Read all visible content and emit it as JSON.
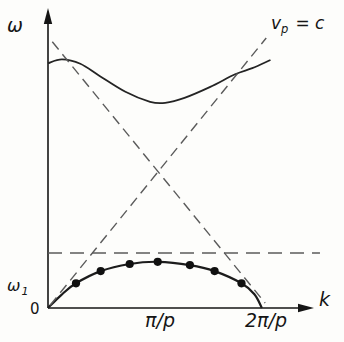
{
  "figure": {
    "background": "#fdfdfb",
    "colors": {
      "axis": "#151515",
      "text": "#151515",
      "solid_curve": "#1c1c1c",
      "dashed_line": "#5b5b5b",
      "dot": "#101010"
    }
  },
  "labels": {
    "y_axis": "ω",
    "y_tick_base": "ω",
    "y_tick_sub": "1",
    "origin": "0",
    "x_tick_mid": "π/p",
    "x_tick_end": "2π/p",
    "x_axis": "k",
    "phase_velocity_base": "v",
    "phase_velocity_sub": "p",
    "phase_velocity_rest": "= c"
  },
  "chart_data": {
    "type": "line",
    "title": "",
    "xlabel": "k",
    "ylabel": "ω",
    "x_units": "π/p",
    "y_units": "ω1",
    "x_tick_labels": [
      "0",
      "π/p",
      "2π/p"
    ],
    "x_tick_positions": [
      0,
      1,
      2
    ],
    "y_tick_labels": [
      "ω1"
    ],
    "grid": false,
    "annotations": [
      {
        "text": "vp = c",
        "target": "light-line-forward",
        "position": "top-right"
      }
    ],
    "series": [
      {
        "name": "first-passband",
        "line": "solid",
        "smooth": true,
        "color": "#1c1c1c",
        "points": [
          [
            0,
            0
          ],
          [
            0.13,
            0.25
          ],
          [
            0.26,
            0.45
          ],
          [
            0.49,
            0.67
          ],
          [
            0.76,
            0.8
          ],
          [
            1.02,
            0.84
          ],
          [
            1.32,
            0.78
          ],
          [
            1.55,
            0.67
          ],
          [
            1.8,
            0.45
          ],
          [
            1.92,
            0.25
          ],
          [
            1.99,
            0
          ]
        ],
        "markers": [
          [
            0.26,
            0.45
          ],
          [
            0.49,
            0.67
          ],
          [
            0.76,
            0.8
          ],
          [
            1.02,
            0.84
          ],
          [
            1.32,
            0.78
          ],
          [
            1.55,
            0.67
          ],
          [
            1.8,
            0.45
          ]
        ]
      },
      {
        "name": "second-passband",
        "line": "solid",
        "smooth": true,
        "color": "#242424",
        "points": [
          [
            0,
            4.45
          ],
          [
            0.13,
            4.52
          ],
          [
            0.3,
            4.44
          ],
          [
            0.48,
            4.22
          ],
          [
            0.72,
            3.93
          ],
          [
            0.95,
            3.75
          ],
          [
            1.09,
            3.73
          ],
          [
            1.27,
            3.82
          ],
          [
            1.51,
            4.02
          ],
          [
            1.74,
            4.25
          ],
          [
            1.9,
            4.36
          ],
          [
            2.07,
            4.51
          ]
        ]
      },
      {
        "name": "light-line-forward",
        "line": "dashed",
        "smooth": false,
        "color": "#5b5b5b",
        "points": [
          [
            0.02,
            0.05
          ],
          [
            2.03,
            4.91
          ]
        ]
      },
      {
        "name": "light-line-backward",
        "line": "dashed",
        "smooth": false,
        "color": "#5b5b5b",
        "points": [
          [
            0.04,
            4.84
          ],
          [
            2.02,
            0.09
          ]
        ]
      },
      {
        "name": "omega1-level",
        "line": "dashed",
        "smooth": false,
        "color": "#5b5b5b",
        "points": [
          [
            0,
            1.0
          ],
          [
            2.53,
            1.0
          ]
        ]
      }
    ]
  }
}
